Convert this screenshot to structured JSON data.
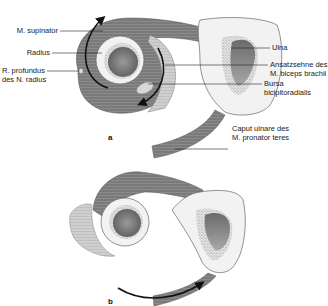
{
  "figure": {
    "panel_a": {
      "letter": "a",
      "labels_left": [
        {
          "text": "M. supinator"
        },
        {
          "text": "Radius"
        },
        {
          "line1": "R. profundus",
          "line2": "des N. radius"
        }
      ],
      "labels_right": [
        {
          "text": "Ulna"
        },
        {
          "line1": "Ansatzsehne des",
          "line2": "M. biceps brachii"
        },
        {
          "line1": "Bursa",
          "line2": "bicipitoradialis"
        },
        {
          "line1": "Caput ulnare des",
          "line2": "M. pronator teres"
        }
      ]
    },
    "panel_b": {
      "letter": "b"
    },
    "colors": {
      "muscle_dark": "#6e6e6e",
      "muscle_mid": "#8c8c8c",
      "muscle_light": "#c8c8c8",
      "bone_cortex": "#f2f2f2",
      "bone_marrow": "#7a7a7a",
      "outline": "#555555",
      "arrow": "#111111"
    }
  }
}
